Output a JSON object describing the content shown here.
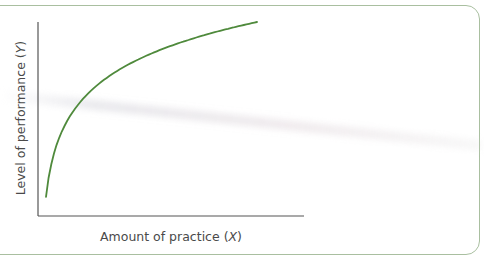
{
  "chart_data": {
    "type": "line",
    "title": "",
    "xlabel": "Amount of practice (X)",
    "ylabel": "Level of performance (Y)",
    "grid": false,
    "legend": null,
    "axis_ticks": false,
    "series": [
      {
        "name": "learning curve",
        "color": "#4f8a3c",
        "shape": "negatively accelerated (diminishing returns)",
        "x": [
          0,
          0.05,
          0.1,
          0.2,
          0.3,
          0.4,
          0.5,
          0.6,
          0.7,
          0.8,
          0.9,
          1.0
        ],
        "y": [
          0.05,
          0.38,
          0.5,
          0.64,
          0.73,
          0.8,
          0.86,
          0.9,
          0.94,
          0.97,
          0.99,
          1.0
        ]
      }
    ],
    "xlim": [
      0,
      1.25
    ],
    "ylim": [
      0,
      1.0
    ]
  },
  "labels": {
    "x_axis": "Amount of practice (",
    "x_var": "X",
    "x_close": ")",
    "y_axis": "Level of performance (",
    "y_var": "Y",
    "y_close": ")"
  },
  "colors": {
    "curve": "#4f8a3c",
    "axis": "#555555",
    "frame_border": "#a9bfa0",
    "text": "#4a4a4a"
  }
}
